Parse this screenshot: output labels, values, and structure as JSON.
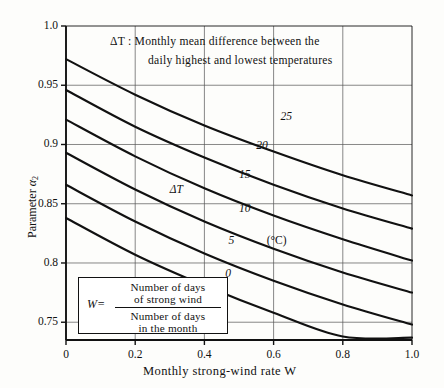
{
  "chart_data": {
    "type": "line",
    "title": "",
    "annotation": "ΔT : Monthly mean difference between the daily highest and lowest temperatures",
    "annotation_line1": "ΔT : Monthly mean difference between the",
    "annotation_line2": "daily highest and lowest temperatures",
    "xlabel": "Monthly strong-wind rate  W",
    "ylabel": "Parameter α₂",
    "xlim": [
      0,
      1.0
    ],
    "ylim": [
      0.735,
      1.0
    ],
    "grid": true,
    "legend_position": "inline-curve-labels",
    "xticks": [
      0,
      0.2,
      0.4,
      0.6,
      0.8,
      1.0
    ],
    "xticklabels": [
      "0",
      "0.2",
      "0.4",
      "0.6",
      "0.8",
      "1.0"
    ],
    "yticks": [
      0.75,
      0.8,
      0.85,
      0.9,
      0.95,
      1.0
    ],
    "yticklabels": [
      "0.75",
      "0.8",
      "0.85",
      "0.9",
      "0.95",
      "1.0"
    ],
    "series_unit": "(°C)",
    "series_variable": "ΔT",
    "x": [
      0,
      0.2,
      0.4,
      0.6,
      0.8,
      1.0
    ],
    "series": [
      {
        "name": "25",
        "label": "25",
        "values": [
          0.972,
          0.942,
          0.916,
          0.894,
          0.874,
          0.857
        ]
      },
      {
        "name": "20",
        "label": "20",
        "values": [
          0.946,
          0.915,
          0.889,
          0.866,
          0.846,
          0.829
        ]
      },
      {
        "name": "15",
        "label": "15",
        "values": [
          0.921,
          0.89,
          0.863,
          0.84,
          0.82,
          0.802
        ]
      },
      {
        "name": "10",
        "label": "10",
        "values": [
          0.893,
          0.862,
          0.835,
          0.812,
          0.792,
          0.775
        ]
      },
      {
        "name": "5",
        "label": "5",
        "values": [
          0.866,
          0.835,
          0.808,
          0.785,
          0.765,
          0.748
        ]
      },
      {
        "name": "0",
        "label": "0",
        "values": [
          0.838,
          0.807,
          0.781,
          0.758,
          0.738,
          0.737
        ]
      }
    ],
    "curve_label_positions": [
      {
        "label": "25",
        "x": 0.62,
        "y": 0.922
      },
      {
        "label": "20",
        "x": 0.55,
        "y": 0.898
      },
      {
        "label": "15",
        "x": 0.5,
        "y": 0.873
      },
      {
        "label": "10",
        "x": 0.5,
        "y": 0.845
      },
      {
        "label": "5",
        "x": 0.47,
        "y": 0.818
      },
      {
        "label": "0",
        "x": 0.46,
        "y": 0.79
      }
    ],
    "inline_annotation": {
      "text": "ΔT",
      "x": 0.3,
      "y": 0.861
    },
    "unit_annotation": {
      "text": "(°C)",
      "x": 0.58,
      "y": 0.818
    }
  },
  "formula": {
    "lhs": "W=",
    "numerator_line1": "Number of days",
    "numerator_line2": "of strong wind",
    "denominator_line1": "Number of days",
    "denominator_line2": "in the month"
  },
  "axis": {
    "y_title_main": "Parameter ",
    "y_title_symbol": "α",
    "y_title_sub": "2",
    "x_title": "Monthly strong-wind rate  W"
  },
  "colors": {
    "ink": "#111111",
    "grid": "#555555",
    "background": "#fdfdfb"
  }
}
